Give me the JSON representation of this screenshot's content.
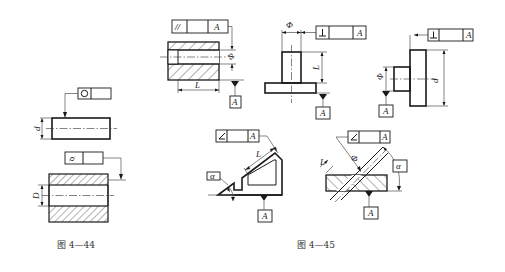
{
  "figures": [
    {
      "caption": "图 4—44",
      "parts": [
        {
          "name": "cylinder",
          "tolerance_symbol": "○",
          "tolerance_type": "roundness",
          "dimension_label": "d"
        },
        {
          "name": "bore",
          "tolerance_symbol": "⌭",
          "tolerance_type": "cylindricity",
          "dimension_label": "D"
        }
      ]
    },
    {
      "caption": "图 4—45",
      "parts": [
        {
          "name": "parallelism-hole",
          "tolerance_symbol": "//",
          "datum": "A",
          "dimension_labels": [
            "Φ",
            "L"
          ]
        },
        {
          "name": "perpendicular-post",
          "tolerance_symbol": "⊥",
          "datum": "A",
          "dimension_labels": [
            "Φ",
            "L"
          ]
        },
        {
          "name": "perpendicular-disk",
          "tolerance_symbol": "⊥",
          "datum": "A",
          "dimension_labels": [
            "Φ",
            "d"
          ]
        },
        {
          "name": "angular-bracket",
          "tolerance_symbol": "∠",
          "datum": "A",
          "dimension_labels": [
            "L",
            "α"
          ]
        },
        {
          "name": "angular-hole",
          "tolerance_symbol": "∠",
          "datum": "A",
          "dimension_labels": [
            "Φ",
            "L",
            "α"
          ]
        }
      ]
    }
  ]
}
